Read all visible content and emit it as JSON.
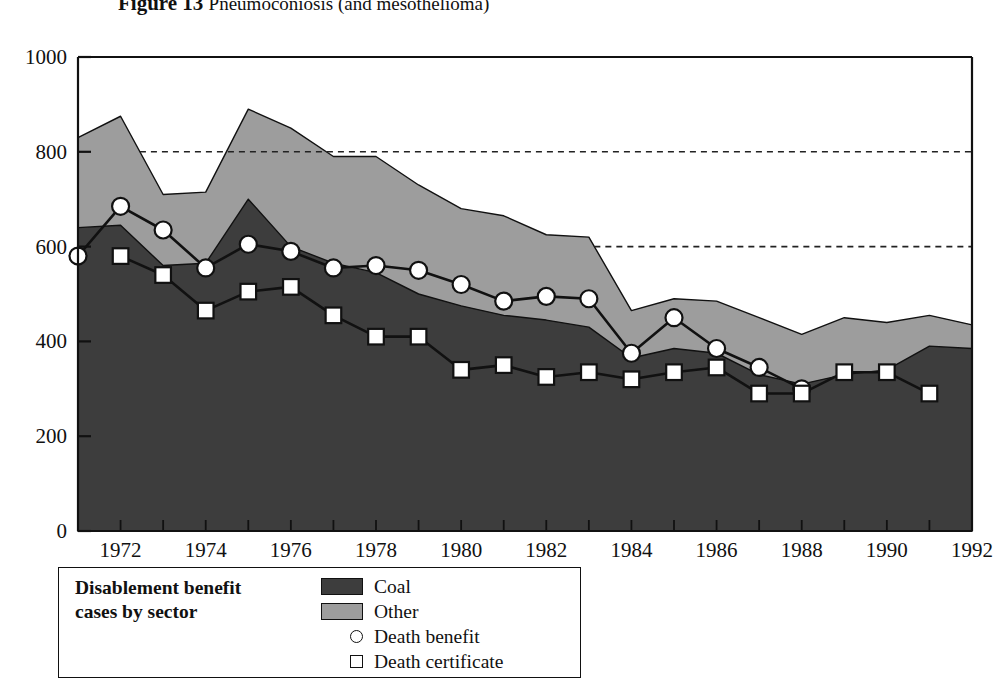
{
  "figure": {
    "number": "Figure 13",
    "caption": "Pneumoconiosis (and mesothelioma)"
  },
  "legend": {
    "title_line1": "Disablement benefit",
    "title_line2": "cases by sector",
    "items": [
      {
        "label": "Coal",
        "marker": "swatch",
        "color": "#3d3d3d"
      },
      {
        "label": "Other",
        "marker": "swatch",
        "color": "#9d9d9d"
      },
      {
        "label": "Death benefit",
        "marker": "circle",
        "color": "#ffffff"
      },
      {
        "label": "Death certificate",
        "marker": "square",
        "color": "#ffffff"
      }
    ]
  },
  "colors": {
    "coal": "#3d3d3d",
    "other": "#9d9d9d",
    "axis": "#111111",
    "marker_fill": "#ffffff",
    "gridline": "#222222"
  },
  "chart_data": {
    "type": "area",
    "title": "Pneumoconiosis (and mesothelioma)",
    "xlabel": "",
    "ylabel": "",
    "xlim": [
      1971,
      1992
    ],
    "ylim": [
      0,
      1000
    ],
    "yticks": [
      0,
      200,
      400,
      600,
      800,
      1000
    ],
    "xticks": [
      1972,
      1974,
      1976,
      1978,
      1980,
      1982,
      1984,
      1986,
      1988,
      1990,
      1992
    ],
    "grid": "dashed horizontal gridlines at 600 and 800, drawn only right of the stacked area",
    "gridlines": [
      600,
      800
    ],
    "legend_position": "below-left",
    "stacked": true,
    "x": [
      1971,
      1972,
      1973,
      1974,
      1975,
      1976,
      1977,
      1978,
      1979,
      1980,
      1981,
      1982,
      1983,
      1984,
      1985,
      1986,
      1987,
      1988,
      1989,
      1990,
      1991,
      1992
    ],
    "series": [
      {
        "name": "Coal",
        "type": "area",
        "values": [
          640,
          645,
          560,
          565,
          700,
          600,
          565,
          545,
          500,
          475,
          455,
          445,
          430,
          365,
          385,
          375,
          330,
          310,
          330,
          340,
          390,
          385
        ]
      },
      {
        "name": "Other",
        "type": "area",
        "values": [
          190,
          230,
          150,
          150,
          190,
          250,
          245,
          245,
          230,
          205,
          210,
          180,
          190,
          100,
          105,
          110,
          120,
          105,
          120,
          100,
          65,
          50
        ]
      },
      {
        "name": "Total (Coal + Other)",
        "type": "area-top",
        "values": [
          830,
          875,
          710,
          715,
          890,
          850,
          790,
          790,
          730,
          680,
          665,
          625,
          620,
          465,
          490,
          485,
          450,
          415,
          450,
          440,
          455,
          435
        ]
      },
      {
        "name": "Death benefit",
        "type": "line",
        "marker": "circle",
        "values": [
          580,
          685,
          635,
          555,
          605,
          590,
          555,
          560,
          550,
          520,
          485,
          495,
          490,
          375,
          450,
          385,
          345,
          300,
          null,
          null,
          null,
          null
        ]
      },
      {
        "name": "Death certificate",
        "type": "line",
        "marker": "square",
        "values": [
          null,
          580,
          540,
          465,
          505,
          515,
          455,
          410,
          410,
          340,
          350,
          325,
          335,
          320,
          335,
          345,
          290,
          290,
          335,
          335,
          290,
          null
        ]
      }
    ]
  }
}
